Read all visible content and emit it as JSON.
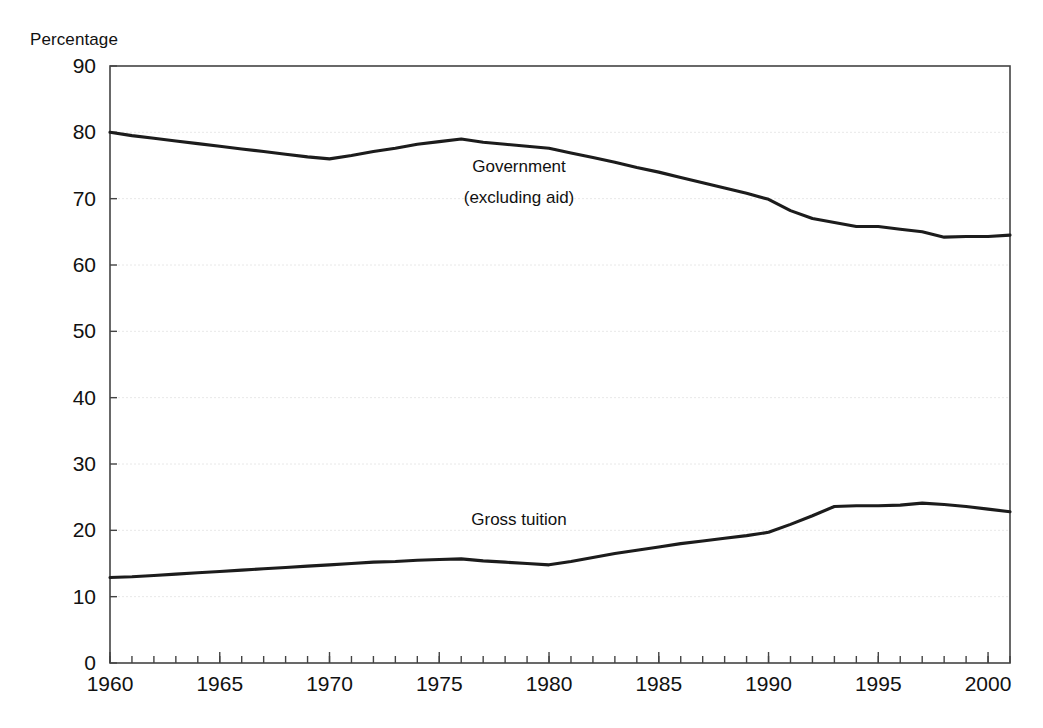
{
  "figure": {
    "axis_unit_label": "Percentage",
    "line_color": "#1c1c1c",
    "grid_color": "#e8e8e8",
    "frame_color": "#444444",
    "background": "#ffffff"
  },
  "annotations": {
    "government_line1": "Government",
    "government_line2": "(excluding aid)",
    "tuition": "Gross tuition"
  },
  "axes": {
    "y_ticks": [
      "0",
      "10",
      "20",
      "30",
      "40",
      "50",
      "60",
      "70",
      "80",
      "90"
    ],
    "x_ticks": [
      "1960",
      "1965",
      "1970",
      "1975",
      "1980",
      "1985",
      "1990",
      "1995",
      "2000"
    ]
  },
  "chart_data": {
    "type": "line",
    "title": "",
    "subtitle": "",
    "xlabel": "",
    "ylabel": "Percentage",
    "xlim": [
      1960,
      2001
    ],
    "ylim": [
      0,
      90
    ],
    "ytick_values": [
      0,
      10,
      20,
      30,
      40,
      50,
      60,
      70,
      80,
      90
    ],
    "xtick_values": [
      1960,
      1965,
      1970,
      1975,
      1980,
      1985,
      1990,
      1995,
      2000
    ],
    "x_minor_tick_step": 1,
    "grid": "horizontal-dotted",
    "legend": "inline-annotations",
    "x": [
      1960,
      1961,
      1962,
      1963,
      1964,
      1965,
      1966,
      1967,
      1968,
      1969,
      1970,
      1971,
      1972,
      1973,
      1974,
      1975,
      1976,
      1977,
      1978,
      1979,
      1980,
      1981,
      1982,
      1983,
      1984,
      1985,
      1986,
      1987,
      1988,
      1989,
      1990,
      1991,
      1992,
      1993,
      1994,
      1995,
      1996,
      1997,
      1998,
      1999,
      2000,
      2001
    ],
    "series": [
      {
        "name": "Government (excluding aid)",
        "color": "#1c1c1c",
        "values": [
          80.0,
          79.5,
          79.1,
          78.7,
          78.3,
          77.9,
          77.5,
          77.1,
          76.7,
          76.3,
          76.0,
          76.5,
          77.1,
          77.6,
          78.2,
          78.6,
          79.0,
          78.5,
          78.2,
          77.9,
          77.6,
          76.9,
          76.2,
          75.5,
          74.7,
          74.0,
          73.2,
          72.4,
          71.6,
          70.8,
          69.9,
          68.2,
          67.0,
          66.4,
          65.8,
          65.8,
          65.4,
          65.0,
          64.2,
          64.3,
          64.3,
          64.5
        ]
      },
      {
        "name": "Gross tuition",
        "color": "#1c1c1c",
        "values": [
          12.9,
          13.0,
          13.2,
          13.4,
          13.6,
          13.8,
          14.0,
          14.2,
          14.4,
          14.6,
          14.8,
          15.0,
          15.2,
          15.3,
          15.5,
          15.6,
          15.7,
          15.4,
          15.2,
          15.0,
          14.8,
          15.3,
          15.9,
          16.5,
          17.0,
          17.5,
          18.0,
          18.4,
          18.8,
          19.2,
          19.7,
          20.9,
          22.2,
          23.6,
          23.7,
          23.7,
          23.8,
          24.1,
          23.9,
          23.6,
          23.2,
          22.8
        ]
      }
    ]
  }
}
